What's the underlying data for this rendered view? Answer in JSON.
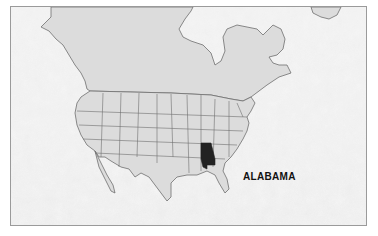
{
  "map": {
    "title": "Location map",
    "highlighted_state": "ALABAMA",
    "label": "ALABAMA",
    "colors": {
      "land": "#dcdcdc",
      "ocean": "#f2f2f2",
      "ocean_texture": "#d6d6d6",
      "border": "#6e6e6e",
      "highlight": "#222222",
      "frame": "#9a9a9a"
    }
  }
}
